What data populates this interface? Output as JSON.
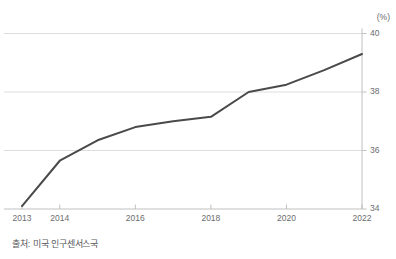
{
  "chart_data": {
    "type": "line",
    "title": "",
    "subtitle": "",
    "xlabel": "",
    "ylabel": "",
    "unit_label": "(%)",
    "x": [
      2013,
      2014,
      2015,
      2016,
      2017,
      2018,
      2019,
      2020,
      2021,
      2022
    ],
    "values": [
      34.1,
      35.65,
      36.35,
      36.8,
      37.0,
      37.15,
      38.0,
      38.25,
      38.75,
      39.3
    ],
    "x_tick_labels": [
      "2013",
      "2014",
      "2016",
      "2018",
      "2020",
      "2022"
    ],
    "x_tick_values": [
      2013,
      2014,
      2016,
      2018,
      2020,
      2022
    ],
    "y_tick_labels": [
      "40",
      "38",
      "36",
      "34"
    ],
    "y_tick_values": [
      40,
      38,
      36,
      34
    ],
    "xlim": [
      2013,
      2022
    ],
    "ylim": [
      34,
      40
    ],
    "grid": true,
    "grid_axis": "y",
    "legend": "none",
    "series_color": "#4a4a4a",
    "axis_color": "#b9b9b9",
    "grid_color": "#d4d4d4",
    "text_color": "#6b6c6e",
    "y_axis_position": "right"
  },
  "footer": {
    "source_note": "출처: 미국 인구센서스국"
  }
}
